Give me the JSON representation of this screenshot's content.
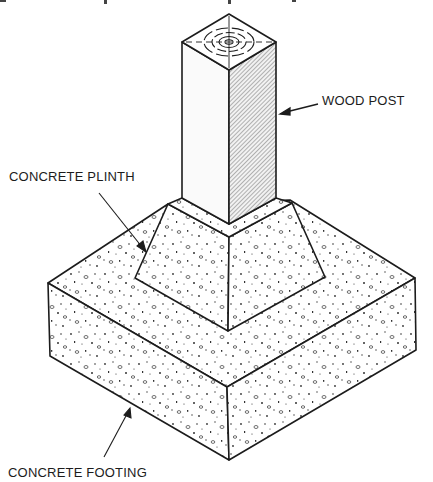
{
  "diagram": {
    "type": "isometric-construction-detail",
    "labels": {
      "wood_post": "WOOD POST",
      "concrete_plinth": "CONCRETE PLINTH",
      "concrete_footing": "CONCRETE FOOTING"
    },
    "components": [
      {
        "id": "wood-post",
        "label": "WOOD POST",
        "material": "wood",
        "shape": "square prism"
      },
      {
        "id": "concrete-plinth",
        "label": "CONCRETE PLINTH",
        "material": "concrete",
        "shape": "truncated pyramid"
      },
      {
        "id": "concrete-footing",
        "label": "CONCRETE FOOTING",
        "material": "concrete",
        "shape": "rectangular slab"
      }
    ],
    "colors": {
      "ink": "#1c1c1c",
      "background": "#ffffff",
      "hatch": "#8a8a8a"
    }
  }
}
